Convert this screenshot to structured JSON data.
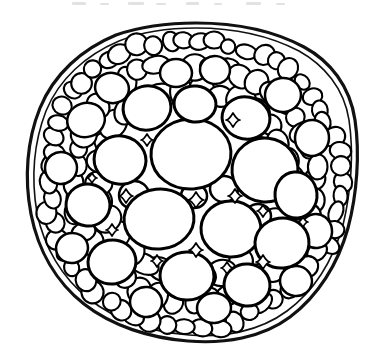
{
  "figure": {
    "kind": "line-drawing",
    "caption": "",
    "background_color": "#ffffff",
    "ink_color": "#000000",
    "canvas": {
      "width": 390,
      "height": 364
    }
  },
  "scan_artifacts": {
    "present": true,
    "description": "faint clipped text descenders along top margin",
    "color": "#d8d8dc",
    "marks": [
      {
        "x": 72,
        "y": 2,
        "w": 14,
        "h": 3
      },
      {
        "x": 100,
        "y": 3,
        "w": 9,
        "h": 2
      },
      {
        "x": 128,
        "y": 2,
        "w": 16,
        "h": 3
      },
      {
        "x": 156,
        "y": 3,
        "w": 10,
        "h": 2
      },
      {
        "x": 186,
        "y": 2,
        "w": 13,
        "h": 3
      },
      {
        "x": 214,
        "y": 3,
        "w": 8,
        "h": 2
      },
      {
        "x": 246,
        "y": 2,
        "w": 15,
        "h": 3
      },
      {
        "x": 276,
        "y": 3,
        "w": 9,
        "h": 2
      }
    ]
  },
  "outline": {
    "name": "epidermis",
    "stroke_width": 3.2,
    "bounds": {
      "left": 27,
      "top": 22,
      "right": 358,
      "bottom": 341
    },
    "path": "M 196 23 C 238 23 276 32 304 47 C 330 61 350 86 355 120 C 360 154 357 194 348 228 C 338 264 318 296 290 317 C 262 338 224 344 188 341 C 150 338 112 326 84 304 C 56 282 38 250 31 214 C 24 178 27 140 40 108 C 54 74 82 49 116 35 C 142 26 170 23 196 23 Z",
    "inner_path": "M 196 28 C 236 28 272 37 299 51 C 324 65 344 88 349 120 C 354 153 351 192 343 225 C 333 260 314 291 287 311 C 260 331 224 338 189 335 C 152 332 116 320 89 299 C 62 278 44 247 37 213 C 31 178 34 142 46 111 C 59 79 86 55 119 41 C 144 31 171 28 196 28 Z"
  },
  "layers": [
    {
      "id": "epidermis",
      "label": "epidermis",
      "cell_size": "small"
    },
    {
      "id": "cortex-outer",
      "label": "outer cortex",
      "cell_size": "small"
    },
    {
      "id": "cortex-inner",
      "label": "inner cortex",
      "cell_size": "medium"
    },
    {
      "id": "pith",
      "label": "central parenchyma",
      "cell_size": "large"
    }
  ],
  "cells_large": [
    {
      "cx": 191,
      "cy": 154,
      "rx": 40,
      "ry": 35,
      "rot": -4
    },
    {
      "cx": 265,
      "cy": 170,
      "rx": 33,
      "ry": 32,
      "rot": 6
    },
    {
      "cx": 159,
      "cy": 219,
      "rx": 35,
      "ry": 30,
      "rot": -6
    },
    {
      "cx": 231,
      "cy": 229,
      "rx": 30,
      "ry": 28,
      "rot": 3
    },
    {
      "cx": 120,
      "cy": 160,
      "rx": 26,
      "ry": 24,
      "rot": 12
    },
    {
      "cx": 282,
      "cy": 243,
      "rx": 27,
      "ry": 25,
      "rot": -8
    },
    {
      "cx": 187,
      "cy": 276,
      "rx": 27,
      "ry": 24,
      "rot": 2
    },
    {
      "cx": 112,
      "cy": 262,
      "rx": 24,
      "ry": 22,
      "rot": -10
    },
    {
      "cx": 246,
      "cy": 118,
      "rx": 24,
      "ry": 21,
      "rot": 10
    },
    {
      "cx": 147,
      "cy": 108,
      "rx": 24,
      "ry": 22,
      "rot": -14
    },
    {
      "cx": 247,
      "cy": 285,
      "rx": 23,
      "ry": 21,
      "rot": 5
    },
    {
      "cx": 88,
      "cy": 205,
      "rx": 22,
      "ry": 21,
      "rot": 8
    },
    {
      "cx": 296,
      "cy": 195,
      "rx": 21,
      "ry": 23,
      "rot": -5
    },
    {
      "cx": 195,
      "cy": 104,
      "rx": 21,
      "ry": 18,
      "rot": 6
    }
  ],
  "cells_medium": [
    {
      "cx": 86,
      "cy": 120,
      "rx": 19,
      "ry": 17,
      "rot": -18
    },
    {
      "cx": 112,
      "cy": 88,
      "rx": 17,
      "ry": 15,
      "rot": 14
    },
    {
      "cx": 176,
      "cy": 73,
      "rx": 16,
      "ry": 14,
      "rot": 0
    },
    {
      "cx": 215,
      "cy": 70,
      "rx": 15,
      "ry": 14,
      "rot": 8
    },
    {
      "cx": 283,
      "cy": 95,
      "rx": 18,
      "ry": 17,
      "rot": -6
    },
    {
      "cx": 312,
      "cy": 138,
      "rx": 17,
      "ry": 18,
      "rot": 4
    },
    {
      "cx": 316,
      "cy": 231,
      "rx": 16,
      "ry": 17,
      "rot": -9
    },
    {
      "cx": 296,
      "cy": 281,
      "rx": 16,
      "ry": 15,
      "rot": 6
    },
    {
      "cx": 214,
      "cy": 308,
      "rx": 17,
      "ry": 15,
      "rot": -3
    },
    {
      "cx": 146,
      "cy": 302,
      "rx": 16,
      "ry": 15,
      "rot": 7
    },
    {
      "cx": 72,
      "cy": 248,
      "rx": 16,
      "ry": 15,
      "rot": -12
    },
    {
      "cx": 61,
      "cy": 168,
      "rx": 16,
      "ry": 16,
      "rot": 10
    },
    {
      "cx": 134,
      "cy": 195,
      "rx": 15,
      "ry": 14,
      "rot": -5
    },
    {
      "cx": 224,
      "cy": 189,
      "rx": 14,
      "ry": 13,
      "rot": 4
    },
    {
      "cx": 194,
      "cy": 196,
      "rx": 13,
      "ry": 12,
      "rot": 0
    },
    {
      "cx": 258,
      "cy": 216,
      "rx": 13,
      "ry": 12,
      "rot": 0
    },
    {
      "cx": 259,
      "cy": 148,
      "rx": 12,
      "ry": 11,
      "rot": 0
    }
  ],
  "intercellular_spaces": [
    {
      "cx": 233,
      "cy": 120,
      "r": 7,
      "shape": "diamond"
    },
    {
      "cx": 235,
      "cy": 196,
      "r": 7,
      "shape": "diamond"
    },
    {
      "cx": 196,
      "cy": 200,
      "r": 8,
      "shape": "diamond"
    },
    {
      "cx": 126,
      "cy": 196,
      "r": 7,
      "shape": "diamond"
    },
    {
      "cx": 196,
      "cy": 250,
      "r": 7,
      "shape": "diamond"
    },
    {
      "cx": 263,
      "cy": 262,
      "r": 7,
      "shape": "diamond"
    },
    {
      "cx": 112,
      "cy": 230,
      "r": 6,
      "shape": "diamond"
    },
    {
      "cx": 263,
      "cy": 211,
      "r": 6,
      "shape": "diamond"
    },
    {
      "cx": 157,
      "cy": 261,
      "r": 6,
      "shape": "diamond"
    },
    {
      "cx": 147,
      "cy": 140,
      "r": 6,
      "shape": "diamond"
    },
    {
      "cx": 227,
      "cy": 268,
      "r": 6,
      "shape": "diamond"
    },
    {
      "cx": 303,
      "cy": 222,
      "r": 5,
      "shape": "diamond"
    },
    {
      "cx": 92,
      "cy": 178,
      "r": 5,
      "shape": "diamond"
    }
  ],
  "peripheral_ring_1": {
    "note": "small cortical cells just inside epidermis",
    "count": 58,
    "radius_fraction": 0.9,
    "cell_radius": 9
  },
  "peripheral_ring_2": {
    "note": "second ring of cortical cells",
    "count": 44,
    "radius_fraction": 0.74,
    "cell_radius": 11
  },
  "peripheral_ring_3": {
    "note": "third ring, transitional cell size",
    "count": 30,
    "radius_fraction": 0.58,
    "cell_radius": 13
  }
}
